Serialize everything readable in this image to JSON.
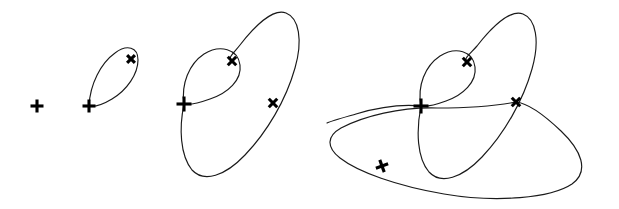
{
  "figure": {
    "title": "Sequence of homoclinic orbit diagrams",
    "description": "Four panels in a row showing successive homoclinic loops: a single equilibrium point, a one-loop orbit, a two-loop orbit, and a three-loop orbit.",
    "background_color": "#ffffff",
    "curve_color": "#1a1a1a",
    "marker_color": "#000000",
    "width": 619,
    "height": 209
  },
  "chart_data": {
    "type": "scatter",
    "title": "Sequence of homoclinic orbit diagrams",
    "xlabel": "",
    "ylabel": "",
    "xlim": [
      0,
      619
    ],
    "ylim": [
      209,
      0
    ],
    "grid": false,
    "legend": null,
    "panels": [
      {
        "index": 1,
        "label": "panel-1",
        "loop_count": 0,
        "markers": [
          {
            "type": "plus",
            "x": 37,
            "y": 106,
            "size": 13
          }
        ],
        "curves": []
      },
      {
        "index": 2,
        "label": "panel-2",
        "loop_count": 1,
        "markers": [
          {
            "type": "plus",
            "x": 89,
            "y": 106,
            "size": 13
          },
          {
            "type": "cross",
            "x": 131,
            "y": 59,
            "size": 11
          }
        ],
        "curves": [
          {
            "name": "loop-1",
            "path": "M 89 106 C 90 84, 101 63, 115 53 C 127 44, 138 47, 138 60 C 138 74, 127 90, 112 99 C 102 105, 94 107, 89 106 Z"
          }
        ]
      },
      {
        "index": 3,
        "label": "panel-3",
        "loop_count": 2,
        "markers": [
          {
            "type": "plus",
            "x": 184,
            "y": 104,
            "size": 15
          },
          {
            "type": "cross",
            "x": 232,
            "y": 61,
            "size": 12
          },
          {
            "type": "cross",
            "x": 273,
            "y": 103,
            "size": 12
          }
        ],
        "curves": [
          {
            "name": "inner-loop",
            "path": "M 184 104 C 181 84, 189 64, 204 54 C 220 44, 238 49, 240 65 C 242 80, 228 93, 210 99 C 199 103, 190 105, 184 104 Z"
          },
          {
            "name": "outer-loop",
            "path": "M 184 104 C 179 128, 180 155, 192 170 C 204 183, 225 176, 245 155 C 267 132, 286 100, 295 68 C 303 40, 299 18, 286 13 C 273 8, 254 27, 240 45 C 233 54, 227 58, 232 61"
          }
        ]
      },
      {
        "index": 4,
        "label": "panel-4",
        "loop_count": 3,
        "markers": [
          {
            "type": "plus",
            "x": 421,
            "y": 106,
            "size": 15
          },
          {
            "type": "cross",
            "x": 467,
            "y": 62,
            "size": 12
          },
          {
            "type": "cross",
            "x": 516,
            "y": 102,
            "size": 12
          },
          {
            "type": "plus",
            "x": 382,
            "y": 166,
            "size": 13,
            "rotation": -20
          }
        ],
        "curves": [
          {
            "name": "inner-loop",
            "path": "M 421 106 C 417 86, 425 66, 440 56 C 456 46, 473 51, 475 67 C 477 82, 463 95, 446 101 C 435 105, 427 107, 421 106 Z"
          },
          {
            "name": "middle-loop",
            "path": "M 421 106 C 416 131, 417 158, 429 172 C 441 185, 462 178, 482 157 C 504 134, 523 101, 532 69 C 540 41, 536 19, 523 14 C 510 9, 491 28, 477 46 C 469 55, 463 59, 467 62"
          },
          {
            "name": "outer-loop",
            "path": "M 516 102 C 495 106, 466 108, 437 108 C 400 107, 364 116, 341 128 C 327 136, 326 147, 340 158 C 358 172, 397 186, 444 194 C 497 203, 551 198, 572 184 C 590 171, 581 150, 561 131 C 542 113, 526 103, 516 102 Z"
          },
          {
            "name": "outer-left-tail",
            "path": "M 421 106 C 400 104, 376 108, 356 114 C 342 118, 331 121, 327 123"
          }
        ]
      }
    ]
  }
}
